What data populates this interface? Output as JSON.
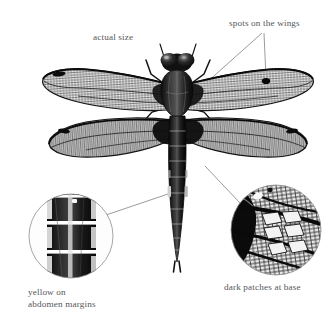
{
  "figure": {
    "style": "black-and-white scientific illustration",
    "background_color": "#ffffff",
    "label_color": "#56575a",
    "leader_line_color": "#6b6c70",
    "inset_outline_color": "#8a8b8f"
  },
  "labels": {
    "actual_size": "actual size",
    "spots_on_wings": "spots on the wings",
    "yellow_margins_line1": "yellow on",
    "yellow_margins_line2": "abdomen margins",
    "dark_patches": "dark patches at base"
  },
  "callouts": [
    {
      "id": "actual-size",
      "text": "actual size",
      "has_leader_line": false,
      "x": 93,
      "y": 32
    },
    {
      "id": "spots-on-the-wings",
      "text": "spots on the wings",
      "has_leader_line": true,
      "leader_targets": [
        "right-wing-pterostigma-spot",
        "forewing-base"
      ],
      "x": 229,
      "y": 18
    },
    {
      "id": "yellow-on-abdomen-margins",
      "text": "yellow on abdomen margins",
      "has_leader_line": true,
      "leader_targets": [
        "abdomen-segment-margin"
      ],
      "inset": "left-inset-circle",
      "x": 28,
      "y": 287
    },
    {
      "id": "dark-patches-at-base",
      "text": "dark patches at base",
      "has_leader_line": true,
      "leader_targets": [
        "hindwing-base"
      ],
      "inset": "right-inset-circle",
      "x": 224,
      "y": 282
    }
  ],
  "insets": [
    {
      "id": "left-inset-circle",
      "name": "abdomen-margin-closeup",
      "cx": 71,
      "cy": 236,
      "r": 42,
      "depicts": "magnified abdomen segments showing pale yellow margin spots"
    },
    {
      "id": "right-inset-circle",
      "name": "wing-base-closeup",
      "cx": 276,
      "cy": 230,
      "r": 45,
      "depicts": "magnified hindwing base showing dark patch and wing cell venation"
    }
  ],
  "specimen": {
    "name": "four-spotted-chaser-dragonfly",
    "wingspan_px": 250,
    "body_length_px": 215,
    "wing_pairs": 2,
    "pterostigma_spot": {
      "x": 266,
      "y": 81
    },
    "abdomen_segments": 10
  }
}
